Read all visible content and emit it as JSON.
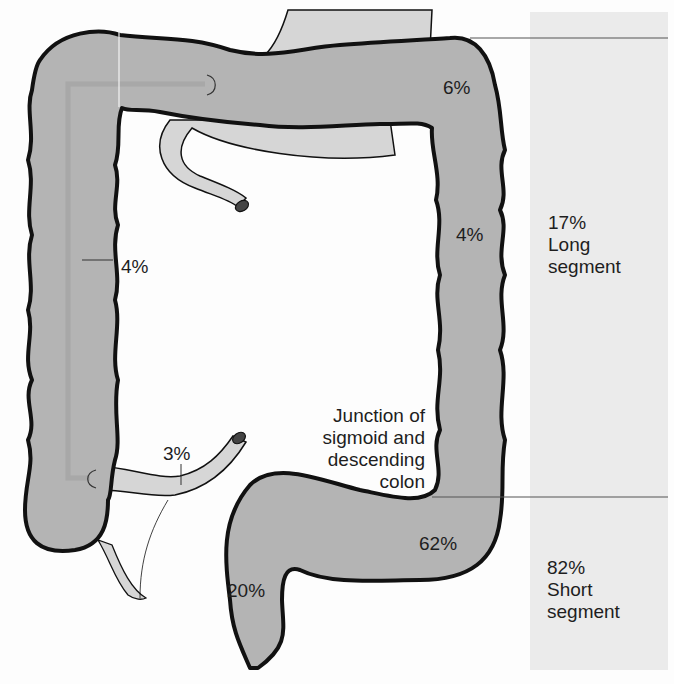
{
  "diagram": {
    "type": "anatomical-diagram",
    "colors": {
      "colon_fill": "#b4b4b4",
      "outline": "#111111",
      "pale_organ_fill": "#d6d6d6",
      "band_fill": "#ebebeb",
      "background": "#fdfdfd",
      "text": "#1e1e1e"
    },
    "region_labels": [
      {
        "id": "transverse-right",
        "text": "6%"
      },
      {
        "id": "descending",
        "text": "4%"
      },
      {
        "id": "ascending",
        "text": "4%"
      },
      {
        "id": "cecum-ileum",
        "text": "3%"
      },
      {
        "id": "sigmoid",
        "text": "62%"
      },
      {
        "id": "rectum",
        "text": "20%"
      }
    ],
    "junction_label": {
      "lines": [
        "Junction of",
        "sigmoid and",
        "descending",
        "colon"
      ]
    },
    "segments": [
      {
        "id": "long",
        "percent": "17%",
        "lines": [
          "Long",
          "segment"
        ]
      },
      {
        "id": "short",
        "percent": "82%",
        "lines": [
          "Short",
          "segment"
        ]
      }
    ]
  }
}
